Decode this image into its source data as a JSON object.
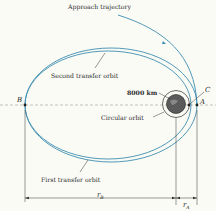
{
  "labels": {
    "approach": "Approach trajectory",
    "second": "Second transfer orbit",
    "first": "First transfer orbit",
    "circular": "Circular orbit",
    "radius": "8000 km",
    "pointA": "A",
    "pointB": "B",
    "pointC": "C",
    "rB": "r",
    "rB_sub": "B",
    "rA": "r",
    "rA_sub": "A"
  },
  "colors": {
    "orbit": "#3d8db0",
    "line": "#333333",
    "planet": "#555555"
  }
}
